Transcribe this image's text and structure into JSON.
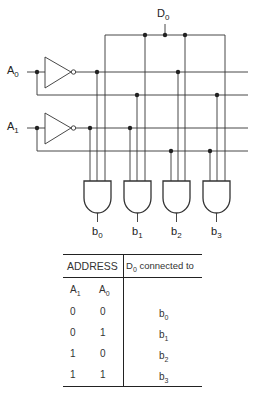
{
  "diagram": {
    "inputs": [
      {
        "name": "A",
        "sub": "0"
      },
      {
        "name": "A",
        "sub": "1"
      }
    ],
    "data_input": {
      "name": "D",
      "sub": "0"
    },
    "outputs": [
      {
        "name": "b",
        "sub": "0"
      },
      {
        "name": "b",
        "sub": "1"
      },
      {
        "name": "b",
        "sub": "2"
      },
      {
        "name": "b",
        "sub": "3"
      }
    ]
  },
  "table": {
    "header_left": "ADDRESS",
    "header_right_prefix": "D",
    "header_right_sub": "0",
    "header_right_suffix": " connected to",
    "col1": {
      "name": "A",
      "sub": "1"
    },
    "col2": {
      "name": "A",
      "sub": "0"
    },
    "rows": [
      {
        "a1": "0",
        "a0": "0",
        "out": "b",
        "out_sub": "0"
      },
      {
        "a1": "0",
        "a0": "1",
        "out": "b",
        "out_sub": "1"
      },
      {
        "a1": "1",
        "a0": "0",
        "out": "b",
        "out_sub": "2"
      },
      {
        "a1": "1",
        "a0": "1",
        "out": "b",
        "out_sub": "3"
      }
    ]
  },
  "colors": {
    "line": "#333333",
    "background": "#ffffff"
  }
}
